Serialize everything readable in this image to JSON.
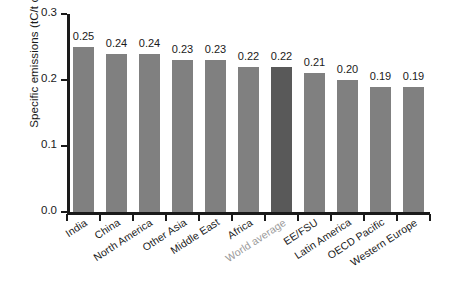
{
  "chart_data": {
    "type": "bar",
    "title": "",
    "subtitle": "",
    "xlabel": "",
    "ylabel": "Specific emissions (tC/t  cement)",
    "ylim": [
      0.0,
      0.3
    ],
    "yticks": [
      "0.0",
      "0.1",
      "0.2",
      "0.3"
    ],
    "ytick_values": [
      0.0,
      0.1,
      0.2,
      0.3
    ],
    "grid": false,
    "legend": "none",
    "orientation": "vertical",
    "categories": [
      "India",
      "China",
      "North America",
      "Other Asia",
      "Middle East",
      "Africa",
      "World average",
      "EE/FSU",
      "Latin America",
      "OECD Pacific",
      "Western Europe"
    ],
    "values": [
      0.25,
      0.24,
      0.24,
      0.23,
      0.23,
      0.22,
      0.22,
      0.21,
      0.2,
      0.19,
      0.19
    ],
    "data_labels": [
      "0.25",
      "0.24",
      "0.24",
      "0.23",
      "0.23",
      "0.22",
      "0.22",
      "0.21",
      "0.20",
      "0.19",
      "0.19"
    ],
    "highlighted_category": "World average",
    "highlighted_index": 6,
    "bar_color": "#808080",
    "highlight_bar_color": "#595959",
    "axis_color": "#1a1a1a",
    "label_color": "#1a1a1a",
    "muted_label_color": "#9a9a9a"
  }
}
